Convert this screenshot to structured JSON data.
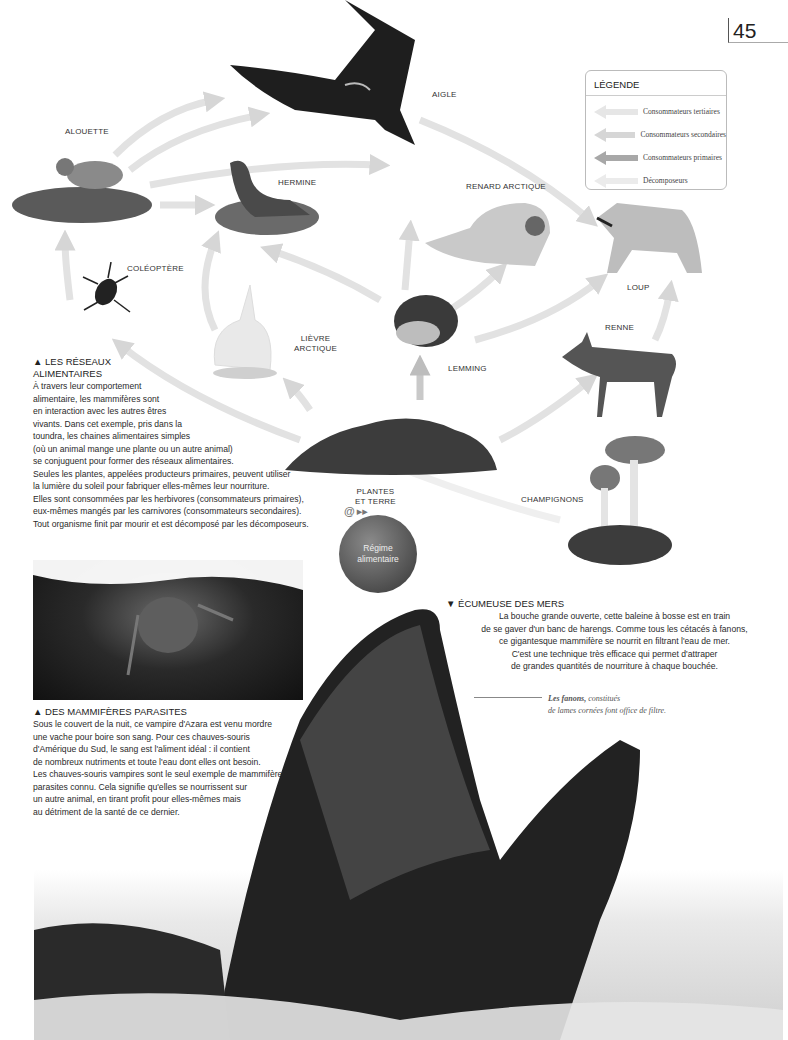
{
  "page": {
    "number": "45"
  },
  "legend": {
    "title": "LÉGENDE",
    "items": [
      {
        "label": "Consommateurs tertiaires",
        "color": "#e8e8e8"
      },
      {
        "label": "Consommateurs secondaires",
        "color": "#d8d8d8"
      },
      {
        "label": "Consommateurs primaires",
        "color": "#a8a8a8"
      },
      {
        "label": "Décomposeurs",
        "color": "#ececec"
      }
    ]
  },
  "food_web": {
    "organisms": [
      {
        "id": "aigle",
        "label": "AIGLE"
      },
      {
        "id": "alouette",
        "label": "ALOUETTE"
      },
      {
        "id": "hermine",
        "label": "HERMINE"
      },
      {
        "id": "renard",
        "label": "RENARD ARCTIQUE"
      },
      {
        "id": "loup",
        "label": "LOUP"
      },
      {
        "id": "coleoptere",
        "label": "COLÉOPTÈRE"
      },
      {
        "id": "lievre",
        "label": "LIÈVRE\nARCTIQUE"
      },
      {
        "id": "lemming",
        "label": "LEMMING"
      },
      {
        "id": "renne",
        "label": "RENNE"
      },
      {
        "id": "plantes",
        "label": "PLANTES\nET TERRE"
      },
      {
        "id": "champignons",
        "label": "CHAMPIGNONS"
      }
    ]
  },
  "reseaux": {
    "title": "▲ LES RÉSEAUX\nALIMENTAIRES",
    "body_narrow": "À travers leur comportement\nalimentaire, les mammifères sont\nen interaction avec les autres êtres\nvivants. Dans cet exemple, pris dans la\ntoundra, les chaines alimentaires simples\n(où un animal mange une plante ou un autre animal)\nse conjuguent pour former des réseaux alimentaires.\nSeules les plantes, appelées producteurs primaires, peuvent utiliser\nla lumière du soleil pour fabriquer elles-mêmes leur nourriture.\nElles sont consommées par les herbivores (consommateurs primaires),\neux-mêmes mangés par les carnivores (consommateurs secondaires).\nTout organisme finit par mourir et est décomposé par les décomposeurs."
  },
  "regime_button": {
    "icon": "@",
    "icon_suffix": "▸▸",
    "label": "Régime\nalimentaire"
  },
  "parasites": {
    "title": "▲ DES MAMMIFÈRES PARASITES",
    "body": "Sous le couvert de la nuit, ce vampire d'Azara est venu mordre\nune vache pour boire son sang. Pour ces chauves-souris\nd'Amérique du Sud, le sang est l'aliment idéal : il contient\nde nombreux nutriments et toute l'eau dont elles ont besoin.\nLes chauves-souris vampires sont le seul exemple de mammifères\nparasites connu. Cela signifie qu'elles se nourrissent sur\nun autre animal, en tirant profit pour elles-mêmes mais\nau détriment de la santé de ce dernier."
  },
  "ecumeuse": {
    "title": "▼ ÉCUMEUSE DES MERS",
    "body": "La bouche grande ouverte, cette baleine à bosse est en train\nde se gaver d'un banc de harengs. Comme tous les cétacés à fanons,\nce gigantesque mammifère se nourrit en filtrant l'eau de mer.\nC'est une technique très efficace qui permet d'attraper\nde grandes quantités de nourriture à chaque bouchée.",
    "note_bold": "Les fanons,",
    "note_rest": " constitués\nde lames cornées font office de filtre."
  }
}
